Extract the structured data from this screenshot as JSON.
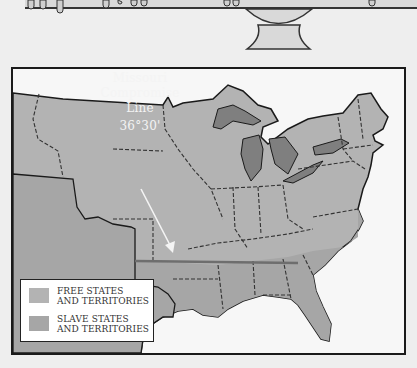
{
  "map": {
    "title_label": {
      "line1": "Missouri",
      "line2": "Compromise",
      "line3": "Line",
      "degree": "36°30'"
    },
    "colors": {
      "free": "#b3b3b3",
      "slave": "#a6a6a6",
      "water": "#7f7f7f",
      "land_outside": "#f7f7f7",
      "compromise_line": "#6e6e6e",
      "border": "#1a1a1a"
    },
    "legend": {
      "items": [
        {
          "label_line1": "FREE STATES",
          "label_line2": "AND TERRITORIES",
          "color": "#b3b3b3"
        },
        {
          "label_line1": "SLAVE STATES",
          "label_line2": "AND TERRITORIES",
          "color": "#a6a6a6"
        }
      ]
    }
  }
}
